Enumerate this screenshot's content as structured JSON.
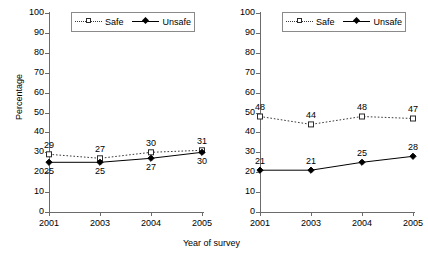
{
  "figure": {
    "shared_xlabel": "Year of survey",
    "shared_ylabel": "Percentage",
    "legend": {
      "safe_label": "Safe",
      "unsafe_label": "Unsafe"
    },
    "axis": {
      "yticks": [
        "0",
        "10",
        "20",
        "30",
        "40",
        "50",
        "60",
        "70",
        "80",
        "90",
        "100"
      ],
      "xticks": [
        "2001",
        "2003",
        "2004",
        "2005"
      ]
    },
    "colors": {
      "safe": "#3a3a3a",
      "unsafe": "#000000",
      "axis": "#6b6b6b",
      "background": "#ffffff"
    }
  },
  "chart_data": [
    {
      "type": "line",
      "panel": "left",
      "title": "",
      "xlabel": "Year of survey",
      "ylabel": "Percentage",
      "categories": [
        "2001",
        "2003",
        "2004",
        "2005"
      ],
      "ylim": [
        0,
        100
      ],
      "ytick_step": 10,
      "grid": false,
      "legend_position": "top-center",
      "series": [
        {
          "name": "Safe",
          "values": [
            29,
            27,
            30,
            31
          ],
          "marker": "open-square",
          "line": "dotted",
          "label_position": "above"
        },
        {
          "name": "Unsafe",
          "values": [
            25,
            25,
            27,
            30
          ],
          "marker": "filled-diamond",
          "line": "solid",
          "label_position": "below"
        }
      ]
    },
    {
      "type": "line",
      "panel": "right",
      "title": "",
      "xlabel": "Year of survey",
      "ylabel": "Percentage",
      "categories": [
        "2001",
        "2003",
        "2004",
        "2005"
      ],
      "ylim": [
        0,
        100
      ],
      "ytick_step": 10,
      "grid": false,
      "legend_position": "top-center",
      "series": [
        {
          "name": "Safe",
          "values": [
            48,
            44,
            48,
            47
          ],
          "marker": "open-square",
          "line": "dotted",
          "label_position": "above"
        },
        {
          "name": "Unsafe",
          "values": [
            21,
            21,
            25,
            28
          ],
          "marker": "filled-diamond",
          "line": "solid",
          "label_position": "above"
        }
      ]
    }
  ]
}
